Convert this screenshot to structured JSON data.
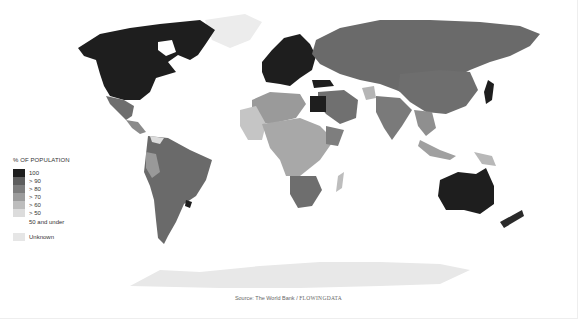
{
  "legend": {
    "title": "% OF POPULATION",
    "items": [
      {
        "label": "100",
        "color": "#1e1e1e"
      },
      {
        "label": "> 90",
        "color": "#5e5e5e"
      },
      {
        "label": "> 80",
        "color": "#7d7d7d"
      },
      {
        "label": "> 70",
        "color": "#9c9c9c"
      },
      {
        "label": "> 60",
        "color": "#bdbdbd"
      },
      {
        "label": "> 50",
        "color": "#dcdcdc"
      }
    ],
    "under_label": "50 and under",
    "unknown": {
      "label": "Unknown",
      "color": "#e6e6e6"
    }
  },
  "source": {
    "prefix": "Source: The World Bank / ",
    "brand": "FLOWINGDATA"
  },
  "regions": {
    "north_america": "100",
    "mexico": "> 90",
    "central_america": "> 80",
    "south_america": "> 90",
    "uruguay": "100",
    "europe": "100",
    "russia": "> 90",
    "china": "> 90",
    "india": "> 80",
    "middle_east": "> 90",
    "turkey": "100",
    "egypt": "100",
    "north_africa": "> 80",
    "west_africa": "> 60",
    "central_africa": "> 70",
    "east_africa": "> 70",
    "southern_africa": "> 90",
    "madagascar": "> 60",
    "southeast_asia": "> 80",
    "indonesia": "> 70",
    "japan": "100",
    "australia": "100",
    "new_zealand": "100",
    "greenland": "Unknown",
    "antarctica": "Unknown"
  }
}
